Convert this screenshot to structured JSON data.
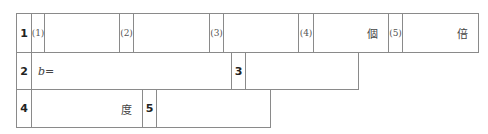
{
  "sheet": {
    "row1": {
      "number": "1",
      "parts": [
        {
          "label": "(1)",
          "unit": ""
        },
        {
          "label": "(2)",
          "unit": ""
        },
        {
          "label": "(3)",
          "unit": ""
        },
        {
          "label": "(4)",
          "unit": "個"
        },
        {
          "label": "(5)",
          "unit": "倍"
        }
      ]
    },
    "row2": {
      "q2": {
        "number": "2",
        "prefix": "b="
      },
      "q3": {
        "number": "3",
        "unit": ""
      }
    },
    "row3": {
      "q4": {
        "number": "4",
        "unit": "度"
      },
      "q5": {
        "number": "5",
        "unit": ""
      }
    },
    "colors": {
      "border": "#8a8a8a",
      "background": "#ffffff"
    }
  }
}
